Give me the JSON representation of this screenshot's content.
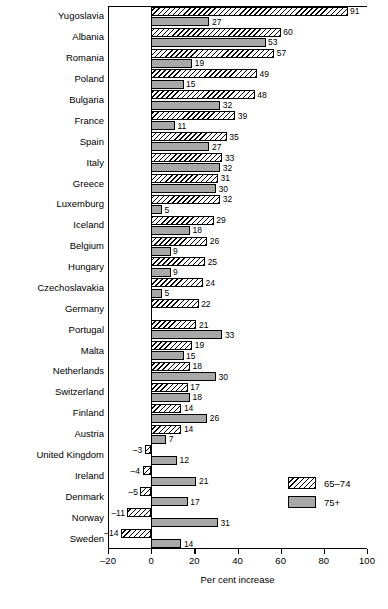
{
  "chart_data": {
    "type": "bar",
    "orientation": "horizontal",
    "title": "",
    "xlabel": "Per cent increase",
    "ylabel": "",
    "xlim": [
      -20,
      100
    ],
    "xticks": [
      -20,
      0,
      20,
      40,
      60,
      80,
      100
    ],
    "xtick_labels": [
      "–20",
      "0",
      "20",
      "40",
      "60",
      "80",
      "100"
    ],
    "grid": false,
    "legend_position": "bottom-right",
    "categories": [
      "Yugoslavia",
      "Albania",
      "Romania",
      "Poland",
      "Bulgaria",
      "France",
      "Spain",
      "Italy",
      "Greece",
      "Luxemburg",
      "Iceland",
      "Belgium",
      "Hungary",
      "Czechoslavakia",
      "Germany",
      "Portugal",
      "Malta",
      "Netherlands",
      "Switzerland",
      "Finland",
      "Austria",
      "United Kingdom",
      "Ireland",
      "Denmark",
      "Norway",
      "Sweden"
    ],
    "series": [
      {
        "name": "65–74",
        "style": "hatched",
        "values": [
          91,
          60,
          57,
          49,
          48,
          39,
          35,
          33,
          31,
          32,
          29,
          26,
          25,
          24,
          22,
          21,
          19,
          18,
          17,
          14,
          14,
          -3,
          -4,
          -5,
          -11,
          -14
        ],
        "labels": [
          "91",
          "60",
          "57",
          "49",
          "48",
          "39",
          "35",
          "33",
          "31",
          "32",
          "29",
          "26",
          "25",
          "24",
          "22",
          "21",
          "19",
          "18",
          "17",
          "14",
          "14",
          "–3",
          "–4",
          "–5",
          "–11",
          "–14"
        ]
      },
      {
        "name": "75+",
        "style": "solid-gray",
        "values": [
          27,
          53,
          19,
          15,
          32,
          11,
          27,
          32,
          30,
          5,
          18,
          9,
          9,
          5,
          null,
          33,
          15,
          30,
          18,
          26,
          7,
          12,
          21,
          17,
          31,
          14
        ],
        "labels": [
          "27",
          "53",
          "19",
          "15",
          "32",
          "11",
          "27",
          "32",
          "30",
          "5",
          "18",
          "9",
          "9",
          "5",
          "",
          "33",
          "15",
          "30",
          "18",
          "26",
          "7",
          "12",
          "21",
          "17",
          "31",
          "14"
        ]
      }
    ],
    "colors": {
      "series_65_74_fill": "#ffffff",
      "series_65_74_hatch": "#000000",
      "series_75plus_fill": "#a8a8a8",
      "axis": "#000000",
      "background": "#ffffff"
    }
  },
  "legend": {
    "items": [
      {
        "label": "65–74",
        "style": "hatched"
      },
      {
        "label": "75+",
        "style": "solid-gray"
      }
    ]
  }
}
